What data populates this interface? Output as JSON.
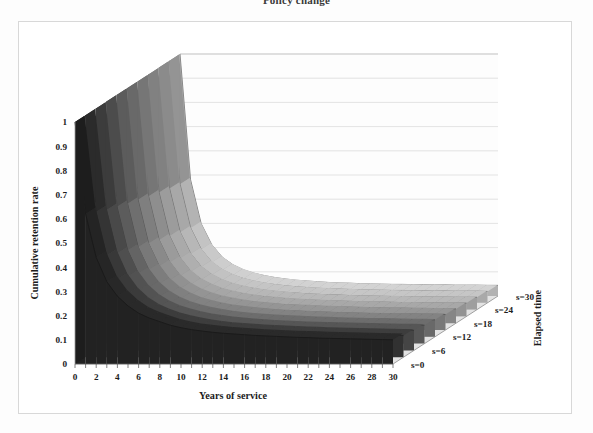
{
  "title": "Policy change",
  "axes": {
    "y_title": "Cumulative retention rate",
    "x_title": "Years of service",
    "z_title": "Elapsed time"
  },
  "chart_data": {
    "type": "line",
    "render": "3d-surface",
    "title": "Policy change",
    "xlabel": "Years of service",
    "ylabel": "Cumulative retention rate",
    "zlabel": "Elapsed time",
    "grid": true,
    "legend_position": "right-depth-axis",
    "xlim": [
      0,
      30
    ],
    "ylim": [
      0,
      1
    ],
    "xticks": [
      0,
      2,
      4,
      6,
      8,
      10,
      12,
      14,
      16,
      18,
      20,
      22,
      24,
      26,
      28,
      30
    ],
    "xtick_labels": [
      "0",
      "2",
      "4",
      "6",
      "8",
      "10",
      "12",
      "14",
      "16",
      "18",
      "20",
      "22",
      "24",
      "26",
      "28",
      "30"
    ],
    "yticks": [
      0,
      0.1,
      0.2,
      0.3,
      0.4,
      0.5,
      0.6,
      0.7,
      0.8,
      0.9,
      1
    ],
    "ytick_labels": [
      "0",
      "0.1",
      "0.2",
      "0.3",
      "0.4",
      "0.5",
      "0.6",
      "0.7",
      "0.8",
      "0.9",
      "1"
    ],
    "z_categories": [
      "s=0",
      "s=6",
      "s=12",
      "s=18",
      "s=24",
      "s=30"
    ],
    "z_tick_labels": [
      "s=0",
      "s=6",
      "s=12",
      "s=18",
      "s=24",
      "s=30"
    ],
    "x": [
      0,
      1,
      2,
      3,
      4,
      5,
      6,
      7,
      8,
      9,
      10,
      11,
      12,
      13,
      14,
      15,
      16,
      17,
      18,
      19,
      20,
      21,
      22,
      23,
      24,
      25,
      26,
      27,
      28,
      29,
      30
    ],
    "series": [
      {
        "name": "s=0",
        "color": "#2a2a2a",
        "values": [
          1.0,
          0.62,
          0.44,
          0.34,
          0.28,
          0.24,
          0.21,
          0.19,
          0.175,
          0.16,
          0.15,
          0.142,
          0.136,
          0.131,
          0.127,
          0.124,
          0.121,
          0.118,
          0.116,
          0.114,
          0.112,
          0.11,
          0.109,
          0.107,
          0.106,
          0.105,
          0.104,
          0.103,
          0.102,
          0.101,
          0.1
        ]
      },
      {
        "name": "s=3",
        "color": "#3d3d3d",
        "values": [
          1.0,
          0.6,
          0.42,
          0.322,
          0.262,
          0.222,
          0.194,
          0.174,
          0.159,
          0.147,
          0.138,
          0.13,
          0.124,
          0.119,
          0.115,
          0.112,
          0.109,
          0.107,
          0.105,
          0.103,
          0.101,
          0.1,
          0.098,
          0.097,
          0.096,
          0.095,
          0.094,
          0.093,
          0.092,
          0.091,
          0.09
        ]
      },
      {
        "name": "s=6",
        "color": "#565656",
        "values": [
          1.0,
          0.58,
          0.4,
          0.305,
          0.246,
          0.207,
          0.18,
          0.161,
          0.147,
          0.136,
          0.127,
          0.12,
          0.114,
          0.11,
          0.106,
          0.103,
          0.1,
          0.098,
          0.096,
          0.094,
          0.093,
          0.091,
          0.09,
          0.089,
          0.088,
          0.087,
          0.086,
          0.085,
          0.084,
          0.084,
          0.083
        ]
      },
      {
        "name": "s=9",
        "color": "#6d6d6d",
        "values": [
          1.0,
          0.565,
          0.385,
          0.29,
          0.232,
          0.194,
          0.168,
          0.149,
          0.136,
          0.125,
          0.117,
          0.11,
          0.105,
          0.101,
          0.097,
          0.094,
          0.092,
          0.09,
          0.088,
          0.086,
          0.085,
          0.083,
          0.082,
          0.081,
          0.08,
          0.08,
          0.079,
          0.078,
          0.077,
          0.077,
          0.076
        ]
      },
      {
        "name": "s=12",
        "color": "#838383",
        "values": [
          1.0,
          0.55,
          0.37,
          0.277,
          0.219,
          0.182,
          0.157,
          0.139,
          0.126,
          0.116,
          0.108,
          0.102,
          0.097,
          0.093,
          0.089,
          0.086,
          0.084,
          0.082,
          0.08,
          0.079,
          0.077,
          0.076,
          0.075,
          0.074,
          0.073,
          0.073,
          0.072,
          0.071,
          0.071,
          0.07,
          0.07
        ]
      },
      {
        "name": "s=15",
        "color": "#969696",
        "values": [
          1.0,
          0.538,
          0.357,
          0.264,
          0.207,
          0.171,
          0.147,
          0.13,
          0.117,
          0.108,
          0.1,
          0.094,
          0.09,
          0.086,
          0.082,
          0.08,
          0.078,
          0.076,
          0.074,
          0.073,
          0.071,
          0.07,
          0.069,
          0.068,
          0.068,
          0.067,
          0.066,
          0.066,
          0.065,
          0.065,
          0.064
        ]
      },
      {
        "name": "s=18",
        "color": "#a8a8a8",
        "values": [
          1.0,
          0.525,
          0.344,
          0.252,
          0.196,
          0.161,
          0.138,
          0.121,
          0.109,
          0.1,
          0.093,
          0.087,
          0.083,
          0.079,
          0.076,
          0.074,
          0.072,
          0.07,
          0.068,
          0.067,
          0.066,
          0.065,
          0.064,
          0.063,
          0.062,
          0.062,
          0.061,
          0.061,
          0.06,
          0.06,
          0.059
        ]
      },
      {
        "name": "s=21",
        "color": "#b8b8b8",
        "values": [
          1.0,
          0.512,
          0.332,
          0.241,
          0.186,
          0.152,
          0.13,
          0.113,
          0.102,
          0.093,
          0.086,
          0.081,
          0.077,
          0.073,
          0.07,
          0.068,
          0.066,
          0.064,
          0.063,
          0.062,
          0.06,
          0.059,
          0.059,
          0.058,
          0.057,
          0.057,
          0.056,
          0.056,
          0.055,
          0.055,
          0.055
        ]
      },
      {
        "name": "s=24",
        "color": "#c6c6c6",
        "values": [
          1.0,
          0.5,
          0.32,
          0.231,
          0.177,
          0.144,
          0.122,
          0.106,
          0.095,
          0.087,
          0.08,
          0.075,
          0.071,
          0.068,
          0.065,
          0.063,
          0.061,
          0.06,
          0.058,
          0.057,
          0.056,
          0.055,
          0.054,
          0.054,
          0.053,
          0.053,
          0.052,
          0.052,
          0.051,
          0.051,
          0.051
        ]
      },
      {
        "name": "s=27",
        "color": "#d3d3d3",
        "values": [
          1.0,
          0.49,
          0.309,
          0.221,
          0.168,
          0.136,
          0.115,
          0.1,
          0.089,
          0.081,
          0.075,
          0.07,
          0.066,
          0.063,
          0.06,
          0.058,
          0.057,
          0.055,
          0.054,
          0.053,
          0.052,
          0.051,
          0.051,
          0.05,
          0.05,
          0.049,
          0.049,
          0.048,
          0.048,
          0.048,
          0.047
        ]
      },
      {
        "name": "s=30",
        "color": "#dedede",
        "values": [
          1.0,
          0.48,
          0.299,
          0.212,
          0.16,
          0.129,
          0.108,
          0.094,
          0.084,
          0.076,
          0.07,
          0.065,
          0.062,
          0.059,
          0.056,
          0.054,
          0.053,
          0.051,
          0.05,
          0.049,
          0.048,
          0.048,
          0.047,
          0.047,
          0.046,
          0.046,
          0.045,
          0.045,
          0.045,
          0.044,
          0.044
        ]
      }
    ]
  }
}
